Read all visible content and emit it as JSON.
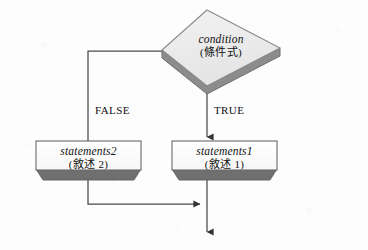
{
  "figure": {
    "kind": "flowchart",
    "background_color": "#fdfdfd"
  },
  "palette": {
    "node_fill": "#ececec",
    "node_fill_light": "#fbfbfb",
    "node_stroke": "#7a7a7a",
    "shadow_fill": "#6f6f6f",
    "line_color": "#4a4a4a",
    "text_color": "#111111"
  },
  "nodes": {
    "condition": {
      "shape": "diamond",
      "label_en": "condition",
      "label_cjk": "(條件式)"
    },
    "statements_false": {
      "shape": "rectangle",
      "label_en": "statements2",
      "label_cjk": "(敘述 2)"
    },
    "statements_true": {
      "shape": "rectangle",
      "label_en": "statements1",
      "label_cjk": "(敘述 1)"
    }
  },
  "edges": {
    "false_branch_label": "FALSE",
    "true_branch_label": "TRUE"
  }
}
